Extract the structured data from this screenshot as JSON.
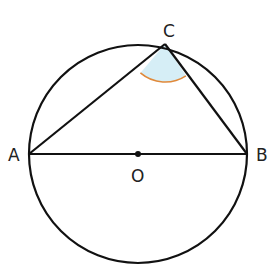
{
  "diagram": {
    "type": "geometry",
    "colors": {
      "stroke": "#111111",
      "angle_fill": "#d6eef6",
      "angle_arc": "#e0893a"
    },
    "points": {
      "A": {
        "label": "A",
        "x": 29,
        "y": 154
      },
      "B": {
        "label": "B",
        "x": 247,
        "y": 154
      },
      "C": {
        "label": "C",
        "x": 165,
        "y": 44
      },
      "O": {
        "label": "O",
        "x": 138,
        "y": 154
      }
    },
    "circle": {
      "cx": 138,
      "cy": 154,
      "r": 109
    }
  }
}
